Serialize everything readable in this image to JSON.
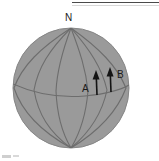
{
  "figure": {
    "name": "rotating-sphere-velocity-diagram",
    "type": "diagram",
    "background_color": "#ffffff",
    "sphere": {
      "fill_color": "#9a9a9a",
      "edge_color": "#8a8a8a",
      "grid_color": "#6e6e6e",
      "center_x": 71,
      "center_y": 88,
      "radius_x": 58,
      "radius_y": 60,
      "meridian_count": 5,
      "equator_visible": true
    },
    "labels": {
      "north_pole": "N",
      "point_a": "A",
      "point_b": "B"
    },
    "arrows": [
      {
        "id": "arrow-a",
        "label": "A",
        "color": "#141414",
        "tail_x": 97,
        "tail_y": 95,
        "tip_x": 96,
        "tip_y": 72
      },
      {
        "id": "arrow-b",
        "label": "B",
        "color": "#141414",
        "tail_x": 111,
        "tail_y": 92,
        "tip_x": 110,
        "tip_y": 69
      }
    ],
    "top_rule": {
      "label": "horizontal-rule",
      "color": "#4a4a4a"
    }
  }
}
